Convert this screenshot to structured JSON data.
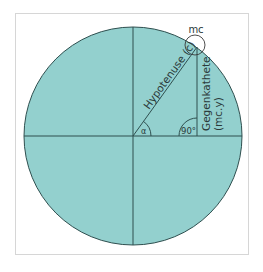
{
  "diagram": {
    "type": "unit-circle-trigonometry",
    "colors": {
      "circle_fill": "#93d0ce",
      "stroke": "#2f4f4f",
      "frame_border": "#d6d6d6",
      "background": "#ffffff"
    },
    "labels": {
      "point": "mc",
      "hypotenuse": "Hypotenuse (c)",
      "opposite_line1": "Gegenkathete",
      "opposite_line2": "(mc.y)",
      "angle_alpha": "α",
      "right_angle": "90°"
    }
  }
}
